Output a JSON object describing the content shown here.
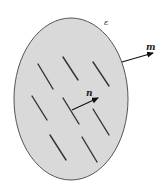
{
  "diagram": {
    "region": {
      "label": "ε",
      "fill": "#d9d9d9",
      "stroke": "#555555",
      "cx": 71,
      "cy": 99,
      "rx": 57,
      "ry": 81
    },
    "outer_normal": {
      "label": "m",
      "from": [
        122,
        62
      ],
      "to": [
        153,
        53
      ]
    },
    "inner_normal": {
      "label": "n",
      "from": [
        72,
        110
      ],
      "to": [
        98,
        98
      ]
    },
    "cracks": [
      {
        "x1": 38,
        "y1": 64,
        "x2": 53,
        "y2": 89
      },
      {
        "x1": 63,
        "y1": 57,
        "x2": 78,
        "y2": 80
      },
      {
        "x1": 93,
        "y1": 62,
        "x2": 109,
        "y2": 86
      },
      {
        "x1": 32,
        "y1": 96,
        "x2": 47,
        "y2": 120
      },
      {
        "x1": 63,
        "y1": 98,
        "x2": 79,
        "y2": 124
      },
      {
        "x1": 93,
        "y1": 109,
        "x2": 109,
        "y2": 135
      },
      {
        "x1": 50,
        "y1": 135,
        "x2": 66,
        "y2": 160
      },
      {
        "x1": 82,
        "y1": 137,
        "x2": 97,
        "y2": 162
      }
    ],
    "crack_color": "#333333"
  }
}
